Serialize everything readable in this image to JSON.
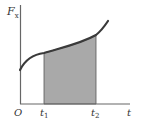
{
  "diagram": {
    "y_axis_label": "F",
    "y_axis_subscript": "x",
    "x_axis_label": "t",
    "origin_label": "O",
    "t1_label": "t",
    "t1_subscript": "1",
    "t2_label": "t",
    "t2_subscript": "2",
    "colors": {
      "axis": "#666666",
      "curve": "#3a3a3a",
      "fill": "#a9a9a9",
      "fill_edge": "#555555"
    }
  }
}
